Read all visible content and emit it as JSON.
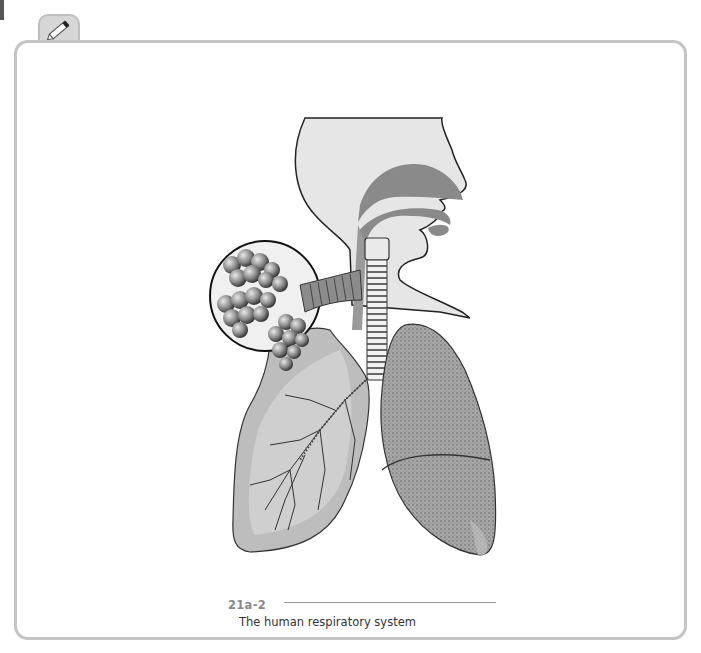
{
  "figure": {
    "parts": [
      "head-profile",
      "nasal-cavity",
      "trachea",
      "bronchi",
      "alveoli-inset",
      "left-lung",
      "right-lung"
    ]
  },
  "caption": {
    "number": "21a-2",
    "text": "The human respiratory system"
  },
  "icons": {
    "tab": "pencil-icon"
  }
}
